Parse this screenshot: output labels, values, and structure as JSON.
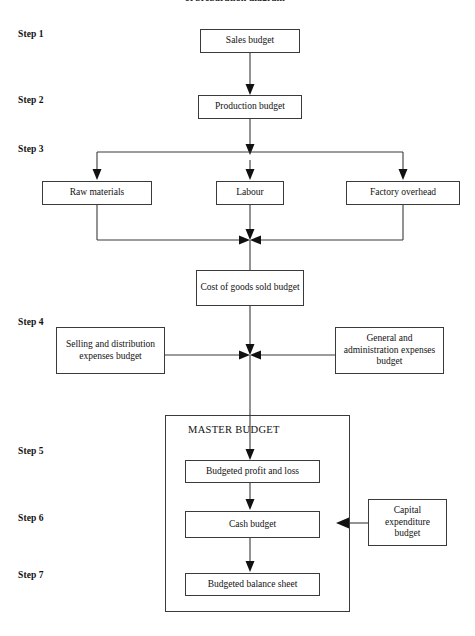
{
  "diagram": {
    "top_title_fragment": "et preparation diagram",
    "master_title": "MASTER        BUDGET"
  },
  "steps": [
    {
      "id": "step-1",
      "label": "Step 1"
    },
    {
      "id": "step-2",
      "label": "Step 2"
    },
    {
      "id": "step-3",
      "label": "Step 3"
    },
    {
      "id": "step-4",
      "label": "Step 4"
    },
    {
      "id": "step-5",
      "label": "Step 5"
    },
    {
      "id": "step-6",
      "label": "Step 6"
    },
    {
      "id": "step-7",
      "label": "Step 7"
    }
  ],
  "nodes": {
    "sales_budget": "Sales budget",
    "production_budget": "Production budget",
    "raw_materials": "Raw  materials",
    "labour": "Labour",
    "factory_overhead": "Factory overhead",
    "cost_of_goods_sold": "Cost of goods sold budget",
    "selling_distribution": "Selling and distribution expenses budget",
    "general_administration": "General and administration expenses budget",
    "budgeted_profit_loss": "Budgeted profit and loss",
    "cash_budget": "Cash budget",
    "budgeted_balance_sheet": "Budgeted balance sheet",
    "capital_expenditure": "Capital expenditure budget"
  },
  "colors": {
    "line": "#3a3a3a",
    "text": "#111111",
    "background": "#ffffff"
  }
}
